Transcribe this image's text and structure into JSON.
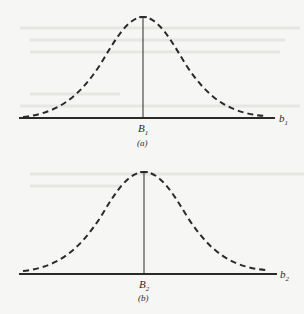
{
  "figures": [
    {
      "id": "a",
      "caption": "(a)",
      "center_label": "B",
      "center_sub": "1",
      "axis_label": "b",
      "axis_sub": "1",
      "curve": "dashed bell-shaped (normal) density"
    },
    {
      "id": "b",
      "caption": "(b)",
      "center_label": "B",
      "center_sub": "2",
      "axis_label": "b",
      "axis_sub": "2",
      "curve": "dashed bell-shaped (normal) density"
    }
  ],
  "colors": {
    "ink": "#2a2a2a",
    "paper": "#f6f6f4"
  }
}
